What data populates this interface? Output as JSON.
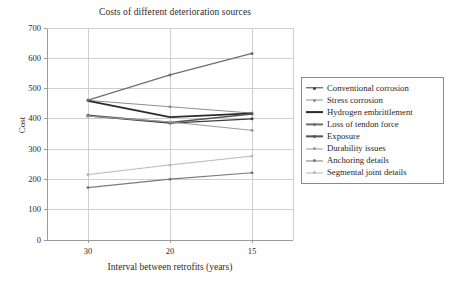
{
  "chart_data": {
    "type": "line",
    "title": "Costs of different deterioration sources",
    "xlabel": "Interval between retrofits (years)",
    "ylabel": "Cost",
    "categories": [
      "30",
      "20",
      "15"
    ],
    "xtick_labels": [
      "30",
      "20",
      "15"
    ],
    "ytick_labels": [
      "0",
      "100",
      "200",
      "300",
      "400",
      "500",
      "600",
      "700"
    ],
    "ylim": [
      0,
      700
    ],
    "ytick_step": 100,
    "grid": "horizontal-and-vertical",
    "legend_position": "right-outside",
    "series": [
      {
        "name": "Conventional corrosion",
        "values": [
          410,
          386,
          400
        ],
        "color": "#3d3d3d",
        "width": 1.4,
        "marker": "dot"
      },
      {
        "name": "Stress corrosion",
        "values": [
          461,
          440,
          419
        ],
        "color": "#8f8f8f",
        "width": 1.0,
        "marker": "dot"
      },
      {
        "name": "Hydrogen embrittlement",
        "values": [
          459,
          406,
          418
        ],
        "color": "#2a2a2a",
        "width": 1.8,
        "marker": "none"
      },
      {
        "name": "Loss of tendon force",
        "values": [
          462,
          545,
          616
        ],
        "color": "#6e6e6e",
        "width": 1.2,
        "marker": "dot"
      },
      {
        "name": "Exposure",
        "values": [
          412,
          388,
          416
        ],
        "color": "#555555",
        "width": 1.3,
        "marker": "dot"
      },
      {
        "name": "Durability issues",
        "values": [
          409,
          390,
          362
        ],
        "color": "#9a9a9a",
        "width": 1.0,
        "marker": "dot"
      },
      {
        "name": "Anchoring details",
        "values": [
          173,
          201,
          222
        ],
        "color": "#7a7a7a",
        "width": 1.1,
        "marker": "dot"
      },
      {
        "name": "Segmental joint details",
        "values": [
          216,
          248,
          277
        ],
        "color": "#b8b8b8",
        "width": 1.0,
        "marker": "dot"
      }
    ]
  },
  "axes": {
    "frame_color": "#9b9b9b",
    "grid_color": "#cfcfcf"
  }
}
